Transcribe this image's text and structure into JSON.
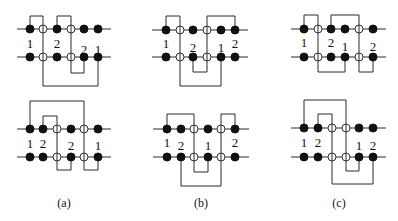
{
  "figure": {
    "panels": [
      {
        "id": "a-top",
        "rows_y": [
          29,
          57
        ],
        "line_x": [
          17,
          111
        ],
        "nodes_x": [
          30,
          43,
          57,
          71,
          84,
          98
        ],
        "top_types": [
          "filled",
          "open",
          "filled",
          "open",
          "filled",
          "filled"
        ],
        "bottom_types": [
          "filled",
          "open",
          "filled",
          "open",
          "filled",
          "filled"
        ],
        "top_loops": [
          {
            "from": 30,
            "to": 43,
            "y": 16
          },
          {
            "from": 57,
            "to": 71,
            "y": 16
          }
        ],
        "bottom_loops": [
          {
            "from": 71,
            "to": 84,
            "y": 73
          },
          {
            "from": 43,
            "to": 98,
            "y": 86
          }
        ],
        "labels": [
          {
            "text": "1",
            "x": 30,
            "y": 48
          },
          {
            "text": "2",
            "x": 57,
            "y": 48
          },
          {
            "text": "2",
            "x": 84,
            "y": 54
          },
          {
            "text": "1",
            "x": 98,
            "y": 54
          }
        ]
      },
      {
        "id": "a-bottom",
        "rows_y": [
          129,
          157
        ],
        "line_x": [
          17,
          111
        ],
        "nodes_x": [
          30,
          43,
          57,
          71,
          84,
          98
        ],
        "top_types": [
          "filled",
          "filled",
          "open",
          "filled",
          "open",
          "filled"
        ],
        "bottom_types": [
          "filled",
          "filled",
          "open",
          "filled",
          "open",
          "filled"
        ],
        "top_loops": [
          {
            "from": 30,
            "to": 84,
            "y": 101
          },
          {
            "from": 43,
            "to": 57,
            "y": 116
          }
        ],
        "bottom_loops": [
          {
            "from": 57,
            "to": 71,
            "y": 170
          },
          {
            "from": 84,
            "to": 98,
            "y": 170
          }
        ],
        "labels": [
          {
            "text": "1",
            "x": 30,
            "y": 148
          },
          {
            "text": "2",
            "x": 43,
            "y": 148
          },
          {
            "text": "2",
            "x": 71,
            "y": 150
          },
          {
            "text": "1",
            "x": 98,
            "y": 150
          }
        ]
      },
      {
        "id": "b-top",
        "rows_y": [
          30,
          57
        ],
        "line_x": [
          152,
          248
        ],
        "nodes_x": [
          166,
          180,
          193,
          207,
          221,
          235
        ],
        "top_types": [
          "filled",
          "open",
          "filled",
          "open",
          "filled",
          "filled"
        ],
        "bottom_types": [
          "filled",
          "open",
          "filled",
          "open",
          "filled",
          "filled"
        ],
        "top_loops": [
          {
            "from": 166,
            "to": 180,
            "y": 16
          },
          {
            "from": 207,
            "to": 235,
            "y": 16
          }
        ],
        "bottom_loops": [
          {
            "from": 193,
            "to": 207,
            "y": 72
          },
          {
            "from": 180,
            "to": 221,
            "y": 86
          }
        ],
        "labels": [
          {
            "text": "1",
            "x": 166,
            "y": 48
          },
          {
            "text": "2",
            "x": 193,
            "y": 52
          },
          {
            "text": "1",
            "x": 221,
            "y": 52
          },
          {
            "text": "2",
            "x": 235,
            "y": 48
          }
        ]
      },
      {
        "id": "b-bottom",
        "rows_y": [
          129,
          157
        ],
        "line_x": [
          153,
          249
        ],
        "nodes_x": [
          167,
          181,
          194,
          208,
          221,
          235
        ],
        "top_types": [
          "filled",
          "filled",
          "open",
          "filled",
          "open",
          "filled"
        ],
        "bottom_types": [
          "filled",
          "filled",
          "open",
          "filled",
          "open",
          "filled"
        ],
        "top_loops": [
          {
            "from": 167,
            "to": 194,
            "y": 114
          },
          {
            "from": 221,
            "to": 235,
            "y": 114
          }
        ],
        "bottom_loops": [
          {
            "from": 194,
            "to": 208,
            "y": 172
          },
          {
            "from": 181,
            "to": 221,
            "y": 186
          }
        ],
        "labels": [
          {
            "text": "1",
            "x": 167,
            "y": 147
          },
          {
            "text": "2",
            "x": 181,
            "y": 150
          },
          {
            "text": "1",
            "x": 208,
            "y": 150
          },
          {
            "text": "2",
            "x": 235,
            "y": 147
          }
        ]
      },
      {
        "id": "c-top",
        "rows_y": [
          29,
          57
        ],
        "line_x": [
          291,
          386
        ],
        "nodes_x": [
          304,
          318,
          331,
          345,
          359,
          373
        ],
        "top_types": [
          "filled",
          "open",
          "filled",
          "filled",
          "open",
          "filled"
        ],
        "bottom_types": [
          "filled",
          "open",
          "filled",
          "filled",
          "open",
          "filled"
        ],
        "top_loops": [
          {
            "from": 304,
            "to": 318,
            "y": 15
          },
          {
            "from": 331,
            "to": 359,
            "y": 15
          }
        ],
        "bottom_loops": [
          {
            "from": 318,
            "to": 345,
            "y": 72
          },
          {
            "from": 359,
            "to": 373,
            "y": 72
          }
        ],
        "labels": [
          {
            "text": "1",
            "x": 304,
            "y": 47
          },
          {
            "text": "2",
            "x": 331,
            "y": 47
          },
          {
            "text": "1",
            "x": 345,
            "y": 51
          },
          {
            "text": "2",
            "x": 373,
            "y": 51
          }
        ]
      },
      {
        "id": "c-bottom",
        "rows_y": [
          128,
          157
        ],
        "line_x": [
          291,
          386
        ],
        "nodes_x": [
          304,
          318,
          332,
          346,
          359,
          373
        ],
        "top_types": [
          "filled",
          "filled",
          "open",
          "open",
          "filled",
          "filled"
        ],
        "bottom_types": [
          "filled",
          "filled",
          "open",
          "open",
          "filled",
          "filled"
        ],
        "top_loops": [
          {
            "from": 304,
            "to": 346,
            "y": 100
          },
          {
            "from": 318,
            "to": 332,
            "y": 114
          }
        ],
        "bottom_loops": [
          {
            "from": 346,
            "to": 359,
            "y": 171
          },
          {
            "from": 332,
            "to": 373,
            "y": 184
          }
        ],
        "labels": [
          {
            "text": "1",
            "x": 304,
            "y": 147
          },
          {
            "text": "2",
            "x": 318,
            "y": 147
          },
          {
            "text": "1",
            "x": 359,
            "y": 150
          },
          {
            "text": "2",
            "x": 373,
            "y": 150
          }
        ]
      }
    ],
    "captions": [
      {
        "text": "(a)",
        "x": 64,
        "y": 207
      },
      {
        "text": "(b)",
        "x": 201,
        "y": 207
      },
      {
        "text": "(c)",
        "x": 339,
        "y": 207
      }
    ]
  }
}
